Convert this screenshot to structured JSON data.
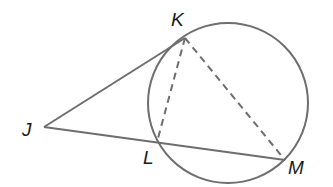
{
  "diagram": {
    "stroke_color": "#6e6e6e",
    "label_color": "#1a1a1a",
    "circle": {
      "cx": 228,
      "cy": 103,
      "r": 80
    },
    "points": {
      "J": {
        "label": "J",
        "x": 44,
        "y": 127
      },
      "K": {
        "label": "K",
        "x": 185,
        "y": 38
      },
      "L": {
        "label": "L",
        "x": 157,
        "y": 142
      },
      "M": {
        "label": "M",
        "x": 285,
        "y": 160
      }
    },
    "segments": [
      {
        "from": "J",
        "to": "K",
        "style": "solid"
      },
      {
        "from": "J",
        "to": "M",
        "style": "solid"
      },
      {
        "from": "K",
        "to": "L",
        "style": "dashed"
      },
      {
        "from": "K",
        "to": "M",
        "style": "dashed"
      }
    ]
  }
}
